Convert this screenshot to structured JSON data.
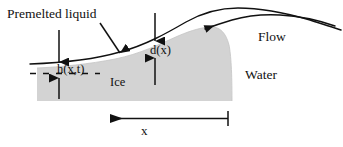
{
  "figure": {
    "kind": "schematic-cross-section",
    "background_color": "#ffffff",
    "line_color": "#111111",
    "ice_fill_color": "#d3d3d3"
  },
  "labels": {
    "premelted_liquid": "Premelted liquid",
    "h_of_x_t": "h(x,t)",
    "d_of_x": "d(x)",
    "ice": "Ice",
    "water": "Water",
    "flow": "Flow",
    "x_axis": "x"
  },
  "regions": [
    {
      "name": "ice",
      "label": "Ice",
      "fill": "#d3d3d3"
    },
    {
      "name": "water",
      "label": "Water",
      "fill": "#ffffff"
    },
    {
      "name": "premelted-film",
      "label": "Premelted liquid",
      "fill": "#ffffff"
    }
  ],
  "annotations": {
    "film_thickness_symbol": "h(x,t)",
    "interface_height_symbol": "d(x)",
    "flow_direction": "leftward",
    "x_axis_direction": "leftward"
  },
  "icons": {
    "down_arrow": "down-arrow-icon",
    "up_arrow": "up-arrow-icon",
    "double_arrow": "double-headed-arrow-icon",
    "left_arrow": "left-arrow-icon",
    "pointer_arrow": "pointer-arrow-icon"
  }
}
